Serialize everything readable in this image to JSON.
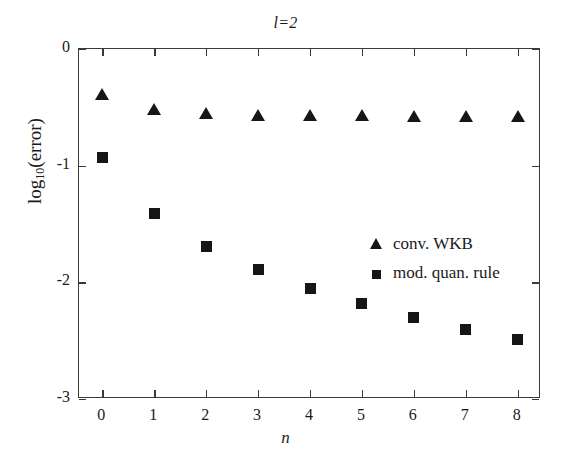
{
  "chart_data": {
    "type": "scatter",
    "title": "l=2",
    "xlabel": "n",
    "ylabel": "log10(error)",
    "ylabel_base": "log",
    "ylabel_sub": "10",
    "ylabel_rest": "(error)",
    "x": [
      0,
      1,
      2,
      3,
      4,
      5,
      6,
      7,
      8
    ],
    "xticks": [
      "0",
      "1",
      "2",
      "3",
      "4",
      "5",
      "6",
      "7",
      "8"
    ],
    "yticks": [
      "0",
      "-1",
      "-2",
      "-3"
    ],
    "ytickvals": [
      0,
      -1,
      -2,
      -3
    ],
    "xlim": [
      -0.45,
      8.45
    ],
    "ylim": [
      -3,
      0
    ],
    "grid": false,
    "legend_position": "center-right-inside",
    "marker_color": "#161616",
    "axis_color": "#3a3a3a",
    "series": [
      {
        "name": "conv. WKB",
        "marker": "triangle",
        "values": [
          -0.39,
          -0.52,
          -0.56,
          -0.57,
          -0.575,
          -0.575,
          -0.58,
          -0.58,
          -0.58
        ]
      },
      {
        "name": "mod. quan. rule",
        "marker": "square",
        "values": [
          -0.93,
          -1.41,
          -1.69,
          -1.89,
          -2.05,
          -2.18,
          -2.3,
          -2.4,
          -2.49
        ]
      }
    ]
  }
}
